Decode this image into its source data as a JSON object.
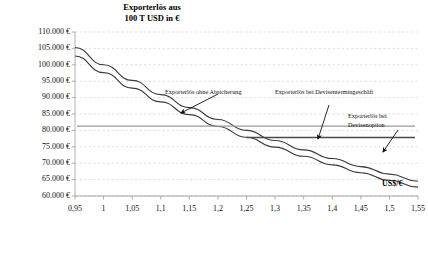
{
  "chart_data": {
    "type": "line",
    "title_line1": "Exporterlös aus",
    "title_line2": "100 T USD in €",
    "xlabel": "US$/€",
    "ylabel": "",
    "xlim": [
      0.95,
      1.55
    ],
    "ylim": [
      60000,
      110000
    ],
    "grid": true,
    "grid_style": "dashed-horizontal",
    "legend_position": "inline-annotations",
    "x_tick_labels": [
      "0,95",
      "1",
      "1,05",
      "1,1",
      "1,15",
      "1,2",
      "1,25",
      "1,3",
      "1,35",
      "1,4",
      "1,45",
      "1,5",
      "1,55"
    ],
    "x_tick_values": [
      0.95,
      1.0,
      1.05,
      1.1,
      1.15,
      1.2,
      1.25,
      1.3,
      1.35,
      1.4,
      1.45,
      1.5,
      1.55
    ],
    "y_tick_labels": [
      "110.000 €",
      "105.000 €",
      "100.000 €",
      "95.000 €",
      "90.000 €",
      "85.000 €",
      "80.000 €",
      "75.000 €",
      "70.000 €",
      "65.000 €",
      "60.000 €"
    ],
    "y_tick_values": [
      110000,
      105000,
      100000,
      95000,
      90000,
      85000,
      80000,
      75000,
      70000,
      65000,
      60000
    ],
    "x": [
      0.95,
      1.0,
      1.05,
      1.1,
      1.15,
      1.2,
      1.25,
      1.3,
      1.35,
      1.4,
      1.45,
      1.5,
      1.55
    ],
    "series": [
      {
        "name": "Exporterlös ohne Absicherung",
        "color": "#3a3a3a",
        "width": 1.1,
        "values": [
          105263,
          100000,
          95238,
          90909,
          86957,
          83333,
          80000,
          76923,
          74074,
          71429,
          68966,
          66667,
          64516
        ]
      },
      {
        "name": "Exporterlös ohne Absicherung (netto)",
        "color": "#3a3a3a",
        "width": 1.1,
        "values": [
          102700,
          97600,
          92900,
          88700,
          84800,
          81200,
          77900,
          74900,
          72100,
          69500,
          67100,
          64800,
          62700
        ]
      },
      {
        "name": "Exporterlös bei Devisentermingeschäft",
        "color": "#9a9a9a",
        "width": 1.4,
        "type": "horizontal",
        "level": 81300
      },
      {
        "name": "Exporterlös bei Devisenoption",
        "color": "#4a4a4a",
        "width": 1.5,
        "type": "floor",
        "floor_level": 77800,
        "kink_x": 1.25
      }
    ],
    "annotations": [
      {
        "id": "ann-ohne-absicherung",
        "text": "Exporterlös ohne Absicherung",
        "x": 165,
        "y": 88,
        "arrow": {
          "x1": 218,
          "y1": 94,
          "x2": 181,
          "y2": 113
        }
      },
      {
        "id": "ann-devisentermingeschaeft",
        "text": "Exporterlös bei Devisentermingeschäft",
        "x": 275,
        "y": 88,
        "arrow": {
          "x1": 329,
          "y1": 105,
          "x2": 318,
          "y2": 139
        }
      },
      {
        "id": "ann-devisenoption",
        "text_line1": "Exporterlös bei",
        "text_line2": "Devisenoption",
        "x": 348,
        "y": 112,
        "arrow": {
          "x1": 398,
          "y1": 130,
          "x2": 383,
          "y2": 152
        }
      }
    ]
  }
}
